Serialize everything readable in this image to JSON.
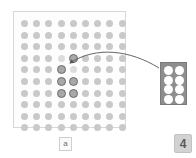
{
  "app": {
    "title": "Tetris-style dot board",
    "background_color": "#ffffff"
  },
  "board": {
    "name": "dot-grid-board",
    "columns": 9,
    "rows": 10,
    "dot_color": "#c9c9c9",
    "ghost_color": "#dcdcdc",
    "active_fill_color": "#a8a8a8",
    "active_ring_color": "#6b6b6b",
    "panel_background": "#fdfdfd",
    "panel_border": "#d8d8d8",
    "label": "a",
    "cells": [
      {
        "col": 3,
        "row": 3,
        "state": "ghost"
      },
      {
        "col": 4,
        "row": 3,
        "state": "active"
      },
      {
        "col": 3,
        "row": 4,
        "state": "active"
      },
      {
        "col": 4,
        "row": 4,
        "state": "ghost"
      },
      {
        "col": 3,
        "row": 5,
        "state": "active"
      },
      {
        "col": 4,
        "row": 5,
        "state": "active"
      },
      {
        "col": 3,
        "row": 6,
        "state": "active"
      },
      {
        "col": 4,
        "row": 6,
        "state": "active"
      }
    ]
  },
  "preview": {
    "name": "next-piece-preview",
    "columns": 2,
    "rows": 4,
    "dot_color": "#ffffff",
    "panel_background": "#8e8e8e",
    "panel_border": "#7a7a7a"
  },
  "arrow": {
    "name": "preview-to-board-arrow",
    "color": "#555555",
    "from": "preview panel",
    "to": "active piece on board"
  },
  "labels": {
    "board_badge": "a",
    "count_badge": "4"
  }
}
